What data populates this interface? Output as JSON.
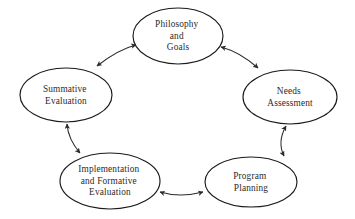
{
  "diagram": {
    "type": "cycle",
    "background_color": "#ffffff",
    "node_fill": "#ffffff",
    "node_stroke": "#1a1a1a",
    "arrow_color": "#2a2a2a",
    "text_color": "#2b2b2b",
    "nodes": [
      {
        "id": "philosophy-and-goals",
        "lines": [
          "Philosophy",
          "and",
          "Goals"
        ],
        "cx": 178,
        "cy": 36,
        "rx": 45,
        "ry": 28
      },
      {
        "id": "needs-assessment",
        "lines": [
          "Needs",
          "Assessment"
        ],
        "cx": 290,
        "cy": 97,
        "rx": 47,
        "ry": 27
      },
      {
        "id": "program-planning",
        "lines": [
          "Program",
          "Planning"
        ],
        "cx": 251,
        "cy": 182,
        "rx": 46,
        "ry": 25
      },
      {
        "id": "implementation-and-formative-evaluation",
        "lines": [
          "Implementation",
          "and Formative",
          "Evaluation"
        ],
        "cx": 110,
        "cy": 181,
        "rx": 50,
        "ry": 28
      },
      {
        "id": "summative-evaluation",
        "lines": [
          "Summative",
          "Evaluation"
        ],
        "cx": 66,
        "cy": 95,
        "rx": 46,
        "ry": 27
      }
    ],
    "connectors": [
      {
        "id": "summative-to-philosophy",
        "from": "summative-evaluation",
        "to": "philosophy-and-goals",
        "style": "double-headed-arrow"
      },
      {
        "id": "philosophy-to-needs",
        "from": "philosophy-and-goals",
        "to": "needs-assessment",
        "style": "double-headed-arrow"
      },
      {
        "id": "needs-to-program",
        "from": "needs-assessment",
        "to": "program-planning",
        "style": "double-headed-arrow"
      },
      {
        "id": "program-to-implementation",
        "from": "program-planning",
        "to": "implementation-and-formative-evaluation",
        "style": "double-headed-arrow"
      },
      {
        "id": "implementation-to-summative",
        "from": "implementation-and-formative-evaluation",
        "to": "summative-evaluation",
        "style": "double-headed-arrow"
      }
    ]
  }
}
